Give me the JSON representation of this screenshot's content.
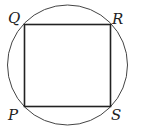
{
  "diagram": {
    "labels": {
      "Q": "Q",
      "R": "R",
      "P": "P",
      "S": "S"
    },
    "colors": {
      "stroke": "#333333",
      "background": "#ffffff"
    }
  }
}
